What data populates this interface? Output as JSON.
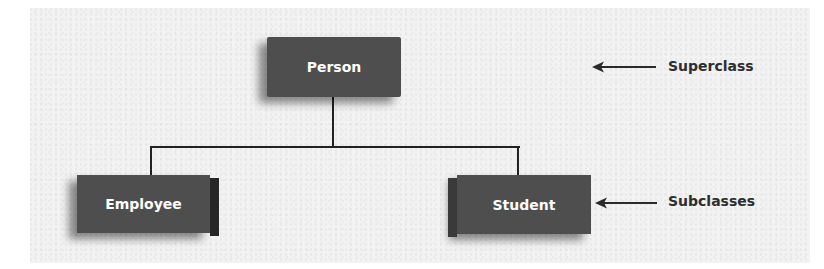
{
  "diagram": {
    "type": "class-hierarchy",
    "superclass": {
      "label": "Person"
    },
    "subclasses": [
      {
        "label": "Employee"
      },
      {
        "label": "Student"
      }
    ],
    "annotations": {
      "superclass_label": "Superclass",
      "subclasses_label": "Subclasses"
    },
    "colors": {
      "box_fill": "#4e4e4e",
      "box_text": "#ffffff",
      "connector": "#222222",
      "annotation_text": "#2e2e2e",
      "background": "#f2f2f2"
    }
  }
}
